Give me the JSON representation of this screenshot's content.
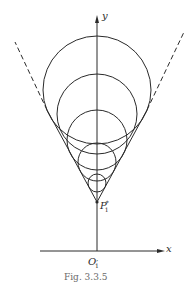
{
  "figure": {
    "caption": "Fig. 3.3.5",
    "colors": {
      "stroke": "#2a2a2a",
      "background": "#ffffff"
    },
    "axes": {
      "x_label": "x",
      "y_label": "y",
      "origin_label": {
        "base": "O",
        "prime": "′",
        "sub": "1"
      }
    },
    "apex_label": {
      "base": "P",
      "sup": "*",
      "sub": "1"
    },
    "apex": {
      "x": 97,
      "y": 202
    },
    "circles": [
      {
        "cx": 97,
        "cy": 90,
        "r": 54
      },
      {
        "cx": 97,
        "cy": 114,
        "r": 40
      },
      {
        "cx": 97,
        "cy": 140,
        "r": 30
      },
      {
        "cx": 97,
        "cy": 162,
        "r": 19
      },
      {
        "cx": 97,
        "cy": 183,
        "r": 9
      }
    ],
    "tangent_lines": [
      {
        "side": "left",
        "solid_to": {
          "x": 47,
          "y": 110
        },
        "dashed_to": {
          "x": 15,
          "y": 42
        }
      },
      {
        "side": "right",
        "solid_to": {
          "x": 147,
          "y": 110
        },
        "dashed_to": {
          "x": 184,
          "y": 32
        }
      }
    ]
  }
}
